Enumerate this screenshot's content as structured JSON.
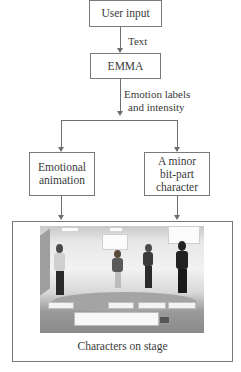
{
  "diagram": {
    "nodes": {
      "user_input": "User input",
      "emma": "EMMA",
      "emotional_animation": "Emotional\nanimation",
      "bit_part": "A minor\nbit-part\ncharacter",
      "stage_caption": "Characters on stage"
    },
    "edges": {
      "user_to_emma": "Text",
      "emma_to_split_line1": "Emotion labels",
      "emma_to_split_line2": "and intensity"
    },
    "colors": {
      "line": "#6e6e6e",
      "border": "#7a7a7a",
      "text": "#3a3a3a"
    }
  }
}
